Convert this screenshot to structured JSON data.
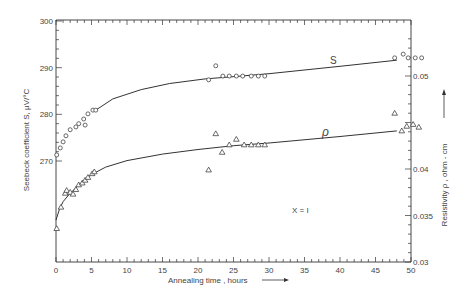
{
  "chart_data": {
    "type": "scatter",
    "title": "",
    "xlabel": "Annealing time , hours",
    "ylabel_left": "Seebeck coefficient S, μV/°C",
    "ylabel_right": "Resistivity ρ , ohm - cm",
    "annotation": "X = I",
    "xlim": [
      0,
      50
    ],
    "ylim_left": [
      270,
      300
    ],
    "ylim_right": [
      0.03,
      0.055
    ],
    "x_ticks": [
      "0",
      "5",
      "10",
      "15",
      "20",
      "25",
      "30",
      "35",
      "40",
      "45",
      "50"
    ],
    "y_left_ticks": [
      "270",
      "280",
      "290",
      "300"
    ],
    "y_right_ticks": [
      "0.03",
      "0.035",
      "0.04",
      "0.05"
    ],
    "grid": false,
    "legend": "curve labels inline",
    "series": [
      {
        "name": "S",
        "axis": "left",
        "marker": "circle",
        "points": [
          [
            0.1,
            271.3
          ],
          [
            0.6,
            272.8
          ],
          [
            1.0,
            274.1
          ],
          [
            1.4,
            275.4
          ],
          [
            2.0,
            276.7
          ],
          [
            2.8,
            277.3
          ],
          [
            3.2,
            278.0
          ],
          [
            3.9,
            279.0
          ],
          [
            4.1,
            277.7
          ],
          [
            4.5,
            280.1
          ],
          [
            5.2,
            280.9
          ],
          [
            5.6,
            280.9
          ],
          [
            21.5,
            287.4
          ],
          [
            22.5,
            290.4
          ],
          [
            23.5,
            288.2
          ],
          [
            24.4,
            288.2
          ],
          [
            25.4,
            288.2
          ],
          [
            26.3,
            288.2
          ],
          [
            27.5,
            288.2
          ],
          [
            28.5,
            288.2
          ],
          [
            29.4,
            288.2
          ],
          [
            47.7,
            292.1
          ],
          [
            48.9,
            292.9
          ],
          [
            49.6,
            292.1
          ],
          [
            50.6,
            292.1
          ],
          [
            51.5,
            292.1
          ]
        ],
        "fit_curve": [
          [
            5.6,
            280.9
          ],
          [
            8,
            283.3
          ],
          [
            12,
            285.3
          ],
          [
            16,
            286.6
          ],
          [
            21,
            287.6
          ],
          [
            26,
            288.2
          ],
          [
            30,
            288.7
          ],
          [
            40,
            290.3
          ],
          [
            48,
            291.6
          ]
        ]
      },
      {
        "name": "ρ",
        "axis": "right",
        "marker": "triangle",
        "points": [
          [
            0.1,
            0.0336
          ],
          [
            0.7,
            0.0359
          ],
          [
            1.3,
            0.0374
          ],
          [
            1.5,
            0.0377
          ],
          [
            2.0,
            0.0375
          ],
          [
            2.4,
            0.0373
          ],
          [
            2.8,
            0.0378
          ],
          [
            3.2,
            0.0383
          ],
          [
            3.7,
            0.0385
          ],
          [
            4.1,
            0.0388
          ],
          [
            4.5,
            0.0391
          ],
          [
            5.1,
            0.0395
          ],
          [
            5.4,
            0.0397
          ],
          [
            21.5,
            0.0399
          ],
          [
            22.5,
            0.0438
          ],
          [
            23.4,
            0.0418
          ],
          [
            24.4,
            0.0426
          ],
          [
            25.4,
            0.0432
          ],
          [
            26.5,
            0.0426
          ],
          [
            27.5,
            0.0426
          ],
          [
            28.5,
            0.0426
          ],
          [
            29.4,
            0.0426
          ],
          [
            47.7,
            0.046
          ],
          [
            48.7,
            0.0441
          ],
          [
            49.4,
            0.0446
          ],
          [
            50.3,
            0.0448
          ],
          [
            51.1,
            0.0445
          ]
        ],
        "fit_curve": [
          [
            0,
            0.0345
          ],
          [
            0.5,
            0.0357
          ],
          [
            1,
            0.0365
          ],
          [
            2,
            0.0374
          ],
          [
            3,
            0.0381
          ],
          [
            4,
            0.0388
          ],
          [
            5,
            0.0394
          ],
          [
            7,
            0.0402
          ],
          [
            10,
            0.0409
          ],
          [
            15,
            0.0416
          ],
          [
            20,
            0.0421
          ],
          [
            25,
            0.0425
          ],
          [
            30,
            0.0428
          ],
          [
            40,
            0.0435
          ],
          [
            48,
            0.0441
          ]
        ]
      }
    ]
  },
  "labels": {
    "curve_S": "S",
    "curve_rho": "ρ",
    "x_label": "Annealing time , hours",
    "y_left_label": "Seebeck coefficient S, μV/°C",
    "y_right_label": "Resistivity ρ , ohm - cm",
    "annotation": "X = I"
  }
}
